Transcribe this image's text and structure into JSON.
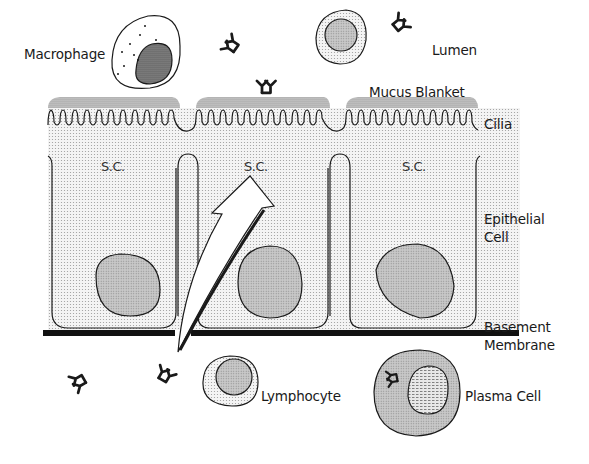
{
  "diagram": {
    "labels": {
      "macrophage": "Macrophage",
      "lumen": "Lumen",
      "mucus_blanket": "Mucus Blanket",
      "cilia": "Cilia",
      "epithelial_cell_line1": "Epithelial",
      "epithelial_cell_line2": "Cell",
      "basement_membrane_line1": "Basement",
      "basement_membrane_line2": "Membrane",
      "lymphocyte": "Lymphocyte",
      "plasma_cell": "Plasma Cell"
    },
    "cells": [
      {
        "label": "S.C.",
        "index": 1
      },
      {
        "label": "S.C.",
        "index": 2
      },
      {
        "label": "S.C.",
        "index": 3
      }
    ],
    "antibody_icons": [
      {
        "region": "lumen",
        "count": 3
      },
      {
        "region": "submucosa",
        "count": 2
      },
      {
        "region": "plasma-cell-interior",
        "count": 1
      }
    ],
    "colors": {
      "ink": "#1a1a1a",
      "stipple_light": "#e6e6e6",
      "stipple_medium": "#c8c8c8",
      "nucleus": "#bdbdbd",
      "membrane": "#111111"
    }
  }
}
